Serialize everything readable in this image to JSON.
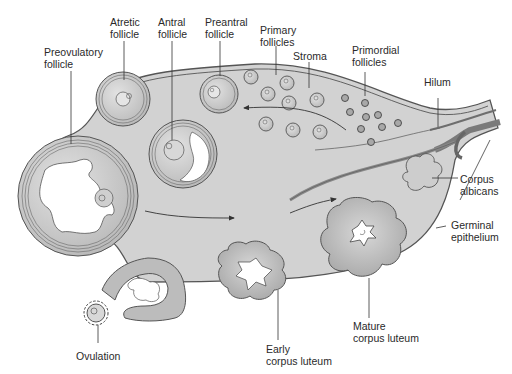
{
  "diagram": {
    "colors": {
      "stroma": "#d2d2d2",
      "outline": "#555555",
      "follicle_fill": "#c4c4c4",
      "luteum_fill": "#b8b8b8",
      "cavity": "#ffffff",
      "vessel": "#8c8c8c",
      "text": "#2a2a2a"
    },
    "labels": {
      "atretic": "Atretic\nfollicle",
      "antral": "Antral\nfollicle",
      "preantral": "Preantral\nfollicle",
      "preovulatory": "Preovulatory\nfollicle",
      "primary": "Primary\nfollicles",
      "stroma": "Stroma",
      "primordial": "Primordial\nfollicles",
      "hilum": "Hilum",
      "corpus_albicans": "Corpus\nalbicans",
      "germinal_epithelium": "Germinal\nepithelium",
      "ovulation": "Ovulation",
      "early_corpus_luteum": "Early\ncorpus luteum",
      "mature_corpus_luteum": "Mature\ncorpus luteum"
    }
  }
}
